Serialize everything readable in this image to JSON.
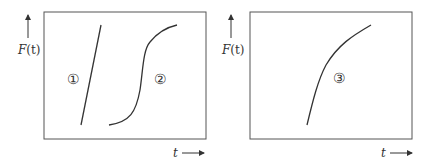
{
  "panels": [
    {
      "y_axis_label": "F(t)",
      "y_label_func": "F",
      "y_label_arg": "(t)",
      "x_axis_label": "t",
      "curves": [
        {
          "id": "1",
          "marker": "①",
          "shape": "straight line, steep increasing"
        },
        {
          "id": "2",
          "marker": "②",
          "shape": "S-shaped (sigmoid) increasing"
        }
      ]
    },
    {
      "y_axis_label": "F(t)",
      "y_label_func": "F",
      "y_label_arg": "(t)",
      "x_axis_label": "t",
      "curves": [
        {
          "id": "3",
          "marker": "③",
          "shape": "concave increasing (decelerating)"
        }
      ]
    }
  ],
  "colors": {
    "line": "#333333",
    "frame": "#555555"
  }
}
